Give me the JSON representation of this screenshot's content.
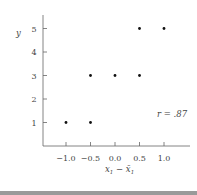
{
  "chart_data": {
    "type": "scatter",
    "title": "",
    "xlabel": "x1 − x̄1",
    "ylabel": "y",
    "xlim": [
      -1.45,
      1.5
    ],
    "ylim": [
      0,
      5.55
    ],
    "grid": false,
    "legend": null,
    "x_ticks": [
      -1.0,
      -0.5,
      0.0,
      0.5,
      1.0
    ],
    "x_tick_labels": [
      "−1.0",
      "−0.5",
      "0.0",
      "0.5",
      "1.0"
    ],
    "y_ticks": [
      1,
      2,
      3,
      4,
      5
    ],
    "y_tick_labels": [
      "1",
      "2",
      "3",
      "4",
      "5"
    ],
    "points": [
      {
        "x": -1.0,
        "y": 1
      },
      {
        "x": -0.5,
        "y": 1
      },
      {
        "x": -0.5,
        "y": 3
      },
      {
        "x": 0.0,
        "y": 3
      },
      {
        "x": 0.5,
        "y": 3
      },
      {
        "x": 0.5,
        "y": 5
      },
      {
        "x": 1.0,
        "y": 5
      }
    ],
    "annotations": [
      {
        "text": "r = .87",
        "x": 1.05,
        "y": 1.75
      }
    ]
  },
  "labels": {
    "y_axis": "y",
    "x_axis_main": "x",
    "x_axis_sub": "1",
    "x_axis_minus": " − ",
    "x_axis_bar": "x̄",
    "x_axis_bar_sub": "1",
    "annotation": "r = .87"
  },
  "colors": {
    "axis": "#555555",
    "point": "#111111",
    "text": "#444444",
    "bottom_bar": "#9a9a9a"
  }
}
